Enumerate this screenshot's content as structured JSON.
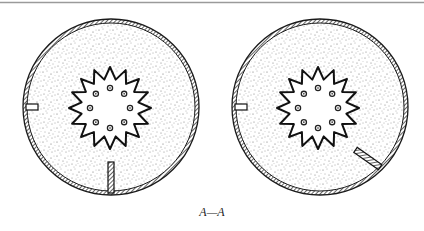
{
  "figure": {
    "top_rule_color": "#9a9a9a",
    "stroke_color": "#1a1a1a",
    "fill_dot_color": "#555555",
    "section_label": "A—A"
  },
  "views": [
    {
      "name": "left-section-view",
      "cx": 111,
      "cy": 107,
      "r": 86,
      "star": {
        "cx": 110,
        "cy": 108,
        "points": 16,
        "outer_r": 41,
        "inner_r": 29
      },
      "holes": {
        "count": 8,
        "r": 20
      },
      "side_port": "left-wall-rectangle",
      "insert": {
        "orientation": "vertical",
        "position": "bottom"
      }
    },
    {
      "name": "right-section-view",
      "cx": 320,
      "cy": 107,
      "r": 86,
      "star": {
        "cx": 318,
        "cy": 108,
        "points": 16,
        "outer_r": 41,
        "inner_r": 29
      },
      "holes": {
        "count": 8,
        "r": 20
      },
      "side_port": "left-wall-rectangle",
      "insert": {
        "orientation": "diagonal",
        "position": "lower-right"
      }
    }
  ]
}
